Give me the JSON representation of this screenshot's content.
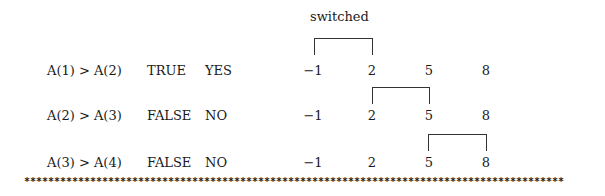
{
  "header": {
    "switched_label": "switched"
  },
  "rows": [
    {
      "comparison": "A(1) > A(2)",
      "result": "TRUE",
      "swap": "YES",
      "values": [
        "−1",
        "2",
        "5",
        "8"
      ],
      "bracket_between": [
        0,
        1
      ]
    },
    {
      "comparison": "A(2) > A(3)",
      "result": "FALSE",
      "swap": "NO",
      "values": [
        "−1",
        "2",
        "5",
        "8"
      ],
      "bracket_between": [
        1,
        2
      ]
    },
    {
      "comparison": "A(3) > A(4)",
      "result": "FALSE",
      "swap": "NO",
      "values": [
        "−1",
        "2",
        "5",
        "8"
      ],
      "bracket_between": [
        2,
        3
      ]
    }
  ],
  "separator": "******************************************************************************************"
}
